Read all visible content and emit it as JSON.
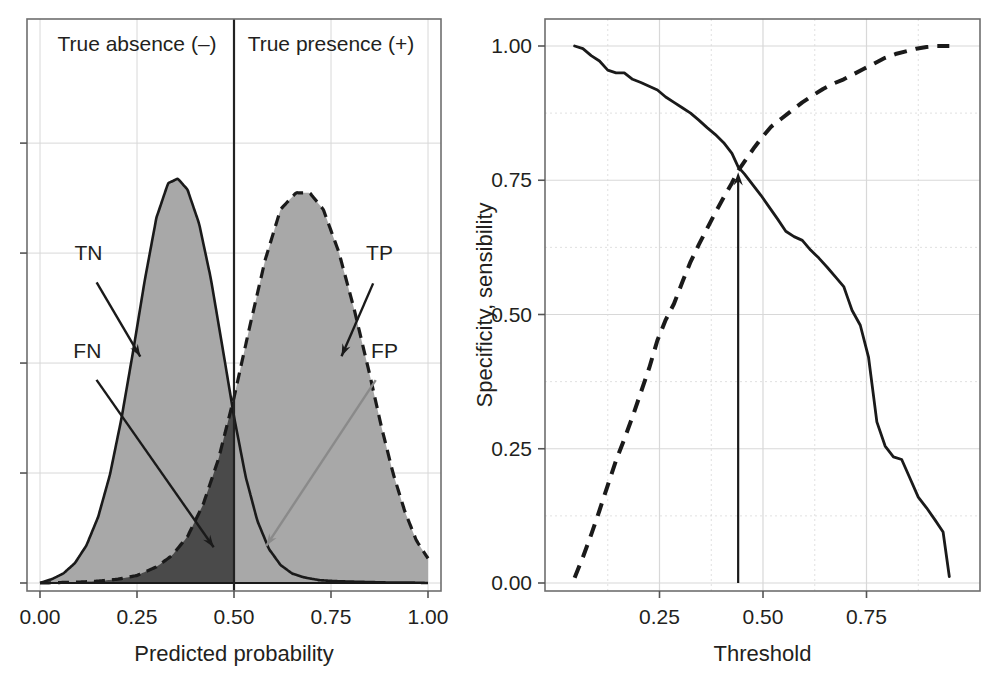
{
  "figure": {
    "background": "#ffffff",
    "panels": [
      "left-density-panel",
      "right-threshold-panel"
    ]
  },
  "colors": {
    "density_fill": "#a8a8a8",
    "overlap_fn_fill": "#4a4a4a",
    "overlap_fp_fill": "#e8e8e8",
    "curve_stroke": "#1a1a1a",
    "grid": "#d8d8d8",
    "frame": "#6e6e6e",
    "text": "#231f20"
  },
  "chart_data": [
    {
      "type": "area",
      "id": "left-density-panel",
      "title": "",
      "xlabel": "Predicted probability",
      "ylabel": "",
      "xlim": [
        0.0,
        1.0
      ],
      "ylim": [
        0.0,
        1.0
      ],
      "xticks": [
        0.0,
        0.25,
        0.5,
        0.75,
        1.0
      ],
      "xticklabels": [
        "0.00",
        "0.25",
        "0.50",
        "0.75",
        "1.00"
      ],
      "yticks": [
        0.0,
        0.25,
        0.5,
        0.75,
        1.0
      ],
      "yticklabels": [
        "",
        "",
        "",
        "",
        ""
      ],
      "grid": true,
      "legend": "none",
      "threshold": 0.5,
      "region_labels": [
        {
          "name": "true-absence",
          "text": "True absence (–)",
          "x": 0.25,
          "y": 0.95
        },
        {
          "name": "true-presence",
          "text": "True presence (+)",
          "x": 0.75,
          "y": 0.95
        }
      ],
      "annotations": [
        {
          "name": "TN",
          "text": "TN",
          "label_x": 0.125,
          "label_y": 0.735,
          "arrow_to_x": 0.265,
          "arrow_to_y": 0.505
        },
        {
          "name": "FN",
          "text": "FN",
          "label_x": 0.122,
          "label_y": 0.512,
          "arrow_to_x": 0.455,
          "arrow_to_y": 0.072
        },
        {
          "name": "TP",
          "text": "TP",
          "label_x": 0.875,
          "label_y": 0.735,
          "arrow_to_x": 0.772,
          "arrow_to_y": 0.505
        },
        {
          "name": "FP",
          "text": "FP",
          "label_x": 0.888,
          "label_y": 0.512,
          "arrow_to_x": 0.576,
          "arrow_to_y": 0.075
        }
      ],
      "series": [
        {
          "name": "absence-density",
          "linestyle": "solid",
          "fill": "#a8a8a8",
          "mean": 0.355,
          "peak": 0.855,
          "x": [
            0.0,
            0.03,
            0.06,
            0.09,
            0.12,
            0.15,
            0.18,
            0.21,
            0.24,
            0.27,
            0.3,
            0.33,
            0.355,
            0.38,
            0.41,
            0.44,
            0.47,
            0.5,
            0.53,
            0.56,
            0.59,
            0.62,
            0.65,
            0.68,
            0.72,
            0.76,
            0.8,
            0.85,
            0.9,
            0.95,
            1.0
          ],
          "values": [
            0.0,
            0.008,
            0.02,
            0.042,
            0.08,
            0.14,
            0.228,
            0.348,
            0.49,
            0.64,
            0.772,
            0.845,
            0.855,
            0.832,
            0.76,
            0.645,
            0.5,
            0.352,
            0.225,
            0.132,
            0.072,
            0.038,
            0.02,
            0.012,
            0.006,
            0.004,
            0.003,
            0.002,
            0.001,
            0.001,
            0.0
          ]
        },
        {
          "name": "presence-density",
          "linestyle": "dashed",
          "fill": "#a8a8a8",
          "mean": 0.695,
          "peak": 0.825,
          "x": [
            0.0,
            0.05,
            0.1,
            0.15,
            0.2,
            0.25,
            0.3,
            0.34,
            0.38,
            0.42,
            0.46,
            0.5,
            0.54,
            0.58,
            0.62,
            0.66,
            0.695,
            0.73,
            0.77,
            0.81,
            0.85,
            0.88,
            0.91,
            0.94,
            0.97,
            1.0
          ],
          "values": [
            0.0,
            0.001,
            0.002,
            0.004,
            0.008,
            0.016,
            0.034,
            0.058,
            0.098,
            0.165,
            0.262,
            0.392,
            0.54,
            0.682,
            0.79,
            0.825,
            0.825,
            0.79,
            0.7,
            0.578,
            0.44,
            0.33,
            0.232,
            0.152,
            0.09,
            0.052
          ]
        }
      ],
      "shaded_regions": [
        {
          "name": "TN-region",
          "description": "absence density left of threshold",
          "fill": "#a8a8a8"
        },
        {
          "name": "TP-region",
          "description": "presence density right of threshold",
          "fill": "#a8a8a8"
        },
        {
          "name": "FN-region",
          "description": "presence density left of threshold",
          "fill": "#4a4a4a"
        },
        {
          "name": "FP-region",
          "description": "absence density right of threshold",
          "fill": "#e8e8e8"
        }
      ]
    },
    {
      "type": "line",
      "id": "right-threshold-panel",
      "title": "",
      "xlabel": "Threshold",
      "ylabel": "Specificity, sensibility",
      "xlim": [
        0.0,
        1.0
      ],
      "ylim": [
        0.0,
        1.0
      ],
      "xticks": [
        0.25,
        0.5,
        0.75
      ],
      "xticklabels": [
        "0.25",
        "0.50",
        "0.75"
      ],
      "yticks": [
        0.0,
        0.25,
        0.5,
        0.75,
        1.0
      ],
      "yticklabels": [
        "0.00",
        "0.25",
        "0.50",
        "0.75",
        "1.00"
      ],
      "grid": true,
      "legend": "none",
      "optimal_threshold": 0.44,
      "optimal_value": 0.77,
      "annotations": [
        {
          "name": "optimal-threshold-arrow",
          "x": 0.44,
          "y_from": 0.0,
          "y_to": 0.765
        }
      ],
      "series": [
        {
          "name": "sensibility",
          "linestyle": "solid",
          "x": [
            0.045,
            0.065,
            0.085,
            0.105,
            0.125,
            0.145,
            0.165,
            0.185,
            0.205,
            0.225,
            0.245,
            0.265,
            0.285,
            0.305,
            0.325,
            0.345,
            0.365,
            0.385,
            0.405,
            0.425,
            0.44,
            0.455,
            0.475,
            0.495,
            0.515,
            0.535,
            0.555,
            0.575,
            0.595,
            0.615,
            0.635,
            0.655,
            0.675,
            0.695,
            0.705,
            0.715,
            0.735,
            0.755,
            0.765,
            0.775,
            0.795,
            0.815,
            0.835,
            0.855,
            0.875,
            0.895,
            0.915,
            0.935,
            0.95
          ],
          "values": [
            1.0,
            0.995,
            0.982,
            0.972,
            0.955,
            0.95,
            0.95,
            0.938,
            0.932,
            0.925,
            0.918,
            0.905,
            0.895,
            0.885,
            0.875,
            0.862,
            0.848,
            0.835,
            0.82,
            0.8,
            0.775,
            0.762,
            0.742,
            0.722,
            0.7,
            0.678,
            0.655,
            0.645,
            0.638,
            0.62,
            0.605,
            0.588,
            0.57,
            0.552,
            0.53,
            0.508,
            0.48,
            0.42,
            0.36,
            0.3,
            0.255,
            0.235,
            0.23,
            0.195,
            0.16,
            0.14,
            0.118,
            0.095,
            0.012
          ]
        },
        {
          "name": "specificity",
          "linestyle": "dashed",
          "x": [
            0.045,
            0.065,
            0.085,
            0.105,
            0.125,
            0.145,
            0.165,
            0.185,
            0.205,
            0.225,
            0.245,
            0.265,
            0.285,
            0.305,
            0.325,
            0.345,
            0.365,
            0.385,
            0.405,
            0.425,
            0.44,
            0.46,
            0.48,
            0.5,
            0.52,
            0.545,
            0.57,
            0.595,
            0.62,
            0.645,
            0.67,
            0.695,
            0.72,
            0.745,
            0.77,
            0.795,
            0.82,
            0.845,
            0.87,
            0.895,
            0.92,
            0.95
          ],
          "values": [
            0.01,
            0.048,
            0.09,
            0.135,
            0.182,
            0.228,
            0.268,
            0.31,
            0.355,
            0.4,
            0.452,
            0.49,
            0.52,
            0.56,
            0.598,
            0.63,
            0.66,
            0.69,
            0.718,
            0.745,
            0.768,
            0.79,
            0.812,
            0.832,
            0.85,
            0.865,
            0.88,
            0.895,
            0.908,
            0.92,
            0.93,
            0.938,
            0.948,
            0.958,
            0.968,
            0.978,
            0.985,
            0.99,
            0.995,
            0.998,
            1.0,
            1.0
          ]
        }
      ]
    }
  ]
}
